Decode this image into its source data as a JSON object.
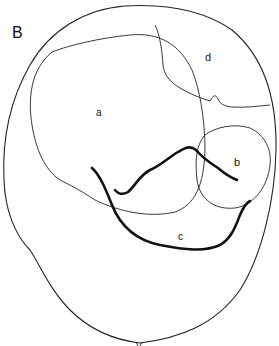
{
  "figure": {
    "panel_label": "B",
    "regions": [
      {
        "id": "a",
        "label": "a"
      },
      {
        "id": "b",
        "label": "b"
      },
      {
        "id": "c",
        "label": "c"
      },
      {
        "id": "d",
        "label": "d"
      }
    ],
    "colors": {
      "stroke": "#222222",
      "background": "#ffffff"
    }
  }
}
